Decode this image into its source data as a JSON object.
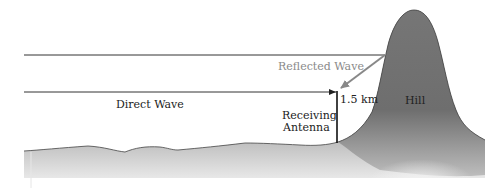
{
  "diagram": {
    "labels": {
      "direct_wave": "Direct Wave",
      "reflected_wave": "Reflected Wave",
      "height": "1.5 km",
      "antenna_line1": "Receiving",
      "antenna_line2": "Antenna",
      "hill": "Hill"
    },
    "colors": {
      "line": "#333333",
      "reflected": "#888888",
      "terrain_dark": "#6e6e6e",
      "terrain_light": "#f2f2f2"
    }
  }
}
